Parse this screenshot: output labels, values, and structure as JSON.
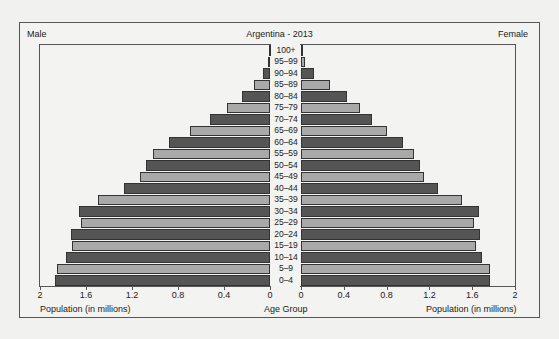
{
  "chart": {
    "title": "Argentina - 2013",
    "left_label": "Male",
    "right_label": "Female",
    "left_xlabel": "Population (in millions)",
    "center_xlabel": "Age Group",
    "right_xlabel": "Population (in millions)",
    "left_ticks": [
      "2",
      "1.6",
      "1.2",
      "0.8",
      "0.4",
      "0"
    ],
    "right_ticks": [
      "0",
      "0.4",
      "0.8",
      "1.2",
      "1.6",
      "2"
    ]
  },
  "colors": {
    "dark": "#555555",
    "light": "#a9a9a9"
  },
  "chart_data": {
    "type": "bar",
    "subtype": "population-pyramid",
    "title": "Argentina - 2013",
    "xlabel": "Population (in millions)",
    "ylabel": "Age Group",
    "xlim": [
      0,
      2
    ],
    "categories": [
      "100+",
      "95–99",
      "90–94",
      "85–89",
      "80–84",
      "75–79",
      "70–74",
      "65–69",
      "60–64",
      "55–59",
      "50–54",
      "45–49",
      "40–44",
      "35–39",
      "30–34",
      "25–29",
      "20–24",
      "15–19",
      "10–14",
      "5–9",
      "0–4"
    ],
    "series": [
      {
        "name": "Male",
        "values": [
          0.01,
          0.02,
          0.06,
          0.14,
          0.24,
          0.37,
          0.52,
          0.7,
          0.88,
          1.02,
          1.08,
          1.13,
          1.27,
          1.5,
          1.66,
          1.64,
          1.73,
          1.72,
          1.77,
          1.85,
          1.87
        ]
      },
      {
        "name": "Female",
        "values": [
          0.01,
          0.04,
          0.12,
          0.27,
          0.43,
          0.55,
          0.66,
          0.8,
          0.95,
          1.06,
          1.11,
          1.15,
          1.28,
          1.5,
          1.66,
          1.62,
          1.67,
          1.64,
          1.69,
          1.77,
          1.77
        ]
      }
    ],
    "grid": false,
    "legend": "none; side labels 'Male' (left) and 'Female' (right)"
  }
}
